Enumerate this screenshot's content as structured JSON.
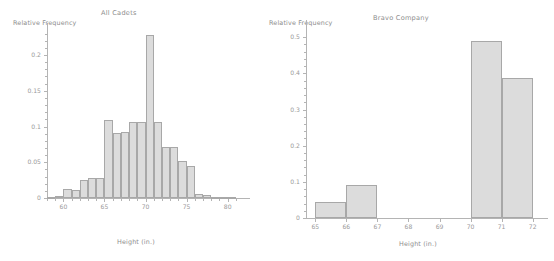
{
  "figure": {
    "width": 554,
    "height": 261,
    "background": "#ffffff",
    "bar_fill": "#dcdcdc",
    "bar_edge": "#a8a8a8",
    "axis_color": "#b4b4b4",
    "text_color": "#8d8d8d"
  },
  "chart_data": [
    {
      "type": "bar",
      "id": "all-cadets",
      "title": "All Cadets",
      "xlabel": "Height (in.)",
      "ylabel": "Relative Frequency",
      "xlim": [
        58.0,
        81.5
      ],
      "ylim": [
        0,
        0.235
      ],
      "grid": false,
      "legend": "none",
      "xticks": [
        60,
        65,
        70,
        75,
        80
      ],
      "xticklabels": [
        "60",
        "65",
        "70",
        "75",
        "80"
      ],
      "yticks": [
        0,
        0.05,
        0.1,
        0.15,
        0.2
      ],
      "yticklabels": [
        "0",
        "0.05",
        "0.1",
        "0.15",
        "0.2"
      ],
      "bin_edges": [
        58,
        59,
        60,
        61,
        62,
        63,
        64,
        65,
        66,
        67,
        68,
        69,
        70,
        71,
        72,
        73,
        74,
        75,
        76,
        77,
        78,
        79,
        80,
        81
      ],
      "categories": [
        "58-59",
        "59-60",
        "60-61",
        "61-62",
        "62-63",
        "63-64",
        "64-65",
        "65-66",
        "66-67",
        "67-68",
        "68-69",
        "69-70",
        "70-71",
        "71-72",
        "72-73",
        "73-74",
        "74-75",
        "75-76",
        "76-77",
        "77-78",
        "78-79",
        "79-80",
        "80-81"
      ],
      "values": [
        0.001,
        0.003,
        0.012,
        0.011,
        0.025,
        0.028,
        0.028,
        0.109,
        0.091,
        0.093,
        0.106,
        0.106,
        0.228,
        0.107,
        0.072,
        0.072,
        0.052,
        0.045,
        0.005,
        0.004,
        0.002,
        0.001,
        0.001
      ]
    },
    {
      "type": "bar",
      "id": "bravo-company",
      "title": "Bravo Company",
      "xlabel": "Height (in.)",
      "ylabel": "Relative Frequency",
      "xlim": [
        64.7,
        72.3
      ],
      "ylim": [
        0,
        0.52
      ],
      "grid": false,
      "legend": "none",
      "xticks": [
        65,
        66,
        67,
        68,
        69,
        70,
        71,
        72
      ],
      "xticklabels": [
        "65",
        "66",
        "67",
        "68",
        "69",
        "70",
        "71",
        "72"
      ],
      "yticks": [
        0,
        0.1,
        0.2,
        0.3,
        0.4,
        0.5
      ],
      "yticklabels": [
        "0",
        "0.1",
        "0.2",
        "0.3",
        "0.4",
        "0.5"
      ],
      "bin_edges": [
        65,
        66,
        67,
        68,
        69,
        70,
        71,
        72
      ],
      "categories": [
        "65-66",
        "66-67",
        "67-68",
        "68-69",
        "69-70",
        "70-71",
        "71-72"
      ],
      "values": [
        0.045,
        0.091,
        0,
        0,
        0,
        0.489,
        0.386
      ]
    }
  ]
}
